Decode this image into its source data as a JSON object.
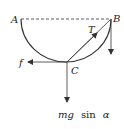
{
  "diagram": {
    "type": "physics-free-body",
    "points": {
      "A": "A",
      "B": "B",
      "C": "C"
    },
    "forces": {
      "tension": "T",
      "friction": "f",
      "gravity_component_m": "mg",
      "gravity_component_sin": "sin",
      "gravity_component_alpha": "α"
    },
    "colors": {
      "stroke": "#333333",
      "background": "#ffffff"
    }
  }
}
